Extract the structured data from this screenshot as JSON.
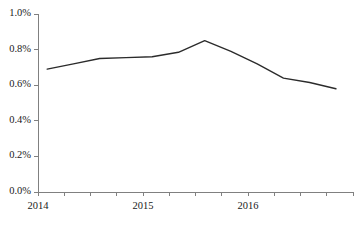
{
  "chart_data": {
    "type": "line",
    "title": "",
    "subtitle": "",
    "xlabel": "",
    "ylabel": "",
    "grid": false,
    "legend": false,
    "legend_position": "none",
    "series_color": "#2b2b2b",
    "axis_color": "#808080",
    "x": [
      "2014 Q1",
      "2014 Q2",
      "2014 Q3",
      "2014 Q4",
      "2015 Q1",
      "2015 Q2",
      "2015 Q3",
      "2015 Q4",
      "2016 Q1",
      "2016 Q2",
      "2016 Q3",
      "2016 Q4"
    ],
    "values": [
      0.69,
      0.72,
      0.75,
      0.755,
      0.76,
      0.785,
      0.85,
      0.79,
      0.72,
      0.64,
      0.615,
      0.58
    ],
    "value_unit": "%",
    "ylim": [
      0.0,
      1.0
    ],
    "ytick_values": [
      0.0,
      0.2,
      0.4,
      0.6,
      0.8,
      1.0
    ],
    "ytick_labels": [
      "0.0%",
      "0.2%",
      "0.4%",
      "0.6%",
      "0.8%",
      "1.0%"
    ],
    "xtick_count": 13,
    "xtick_labels": [
      "2014",
      "2015",
      "2016"
    ],
    "xtick_label_positions": [
      0,
      4,
      8
    ],
    "annotations": []
  }
}
